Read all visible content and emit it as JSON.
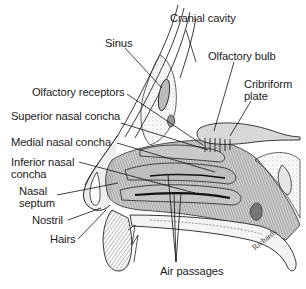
{
  "diagram": {
    "labels": {
      "cranial_cavity": "Cranial cavity",
      "sinus": "Sinus",
      "olfactory_bulb": "Olfactory bulb",
      "olfactory_receptors": "Olfactory receptors",
      "cribriform_plate": "Cribriform\nplate",
      "superior_nasal_concha": "Superior nasal concha",
      "medial_nasal_concha": "Medial nasal concha",
      "inferior_nasal_concha": "Inferior nasal\nconcha",
      "nasal_septum": "Nasal\nseptum",
      "nostril": "Nostril",
      "hairs": "Hairs",
      "air_passages": "Air passages"
    },
    "signature": "Richards",
    "colors": {
      "ink": "#1a1a1a",
      "shade_dark": "#6e6e6e",
      "shade_mid": "#a8a8a8",
      "shade_light": "#d4d4d4",
      "background": "#ffffff"
    }
  }
}
